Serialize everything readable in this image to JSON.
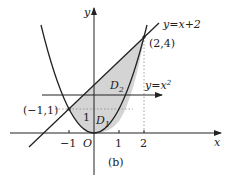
{
  "figure": {
    "caption": "(b)",
    "axes": {
      "x_label": "x",
      "y_label": "y",
      "origin_label": "O",
      "x_ticks": [
        {
          "value": -1,
          "label": "−1"
        },
        {
          "value": 1,
          "label": "1"
        },
        {
          "value": 2,
          "label": "2"
        }
      ],
      "y_tick_label": "1"
    },
    "curves": [
      {
        "name": "parabola",
        "equation": "y=x²",
        "label": "y=x"
      },
      {
        "name": "line",
        "equation": "y=x+2",
        "label": "y=x+2"
      }
    ],
    "points": [
      {
        "label": "(−1,1)",
        "x": -1,
        "y": 1
      },
      {
        "label": "(2,4)",
        "x": 2,
        "y": 4
      }
    ],
    "regions": [
      {
        "label": "D",
        "subscript": "1"
      },
      {
        "label": "D",
        "subscript": "2"
      }
    ],
    "parabola_exponent": "2",
    "colors": {
      "ink": "#222222",
      "shade": "#d4d4d4",
      "guide": "#888888"
    }
  }
}
